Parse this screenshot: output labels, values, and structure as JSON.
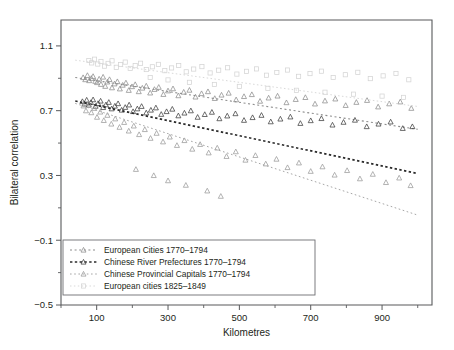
{
  "chart_data": {
    "type": "scatter",
    "title": "",
    "xlabel": "Kilometres",
    "ylabel": "Bilateral correlation",
    "xlim": [
      0,
      1040
    ],
    "ylim": [
      -0.5,
      1.26
    ],
    "grid": false,
    "legend_position": "bottom-left",
    "x_ticks_major": [
      100,
      300,
      500,
      700,
      900
    ],
    "x_ticks_minor": [
      0,
      200,
      400,
      600,
      800,
      1000
    ],
    "y_ticks_major": [
      1.1,
      0.7,
      0.3,
      -0.1,
      -0.5
    ],
    "y_ticks_minor": [
      0.9,
      0.5,
      0.1,
      -0.3
    ],
    "series": [
      {
        "name": "European Cities 1770–1794",
        "marker": "triangle",
        "color": "#8c8c8c",
        "line_color": "#8c8c8c",
        "line_dash": "2,2.6",
        "line_width": 1.1,
        "trend": {
          "x0": 40,
          "y0": 0.905,
          "x1": 1000,
          "y1": 0.585
        },
        "points": [
          [
            62,
            0.905
          ],
          [
            68,
            0.892
          ],
          [
            74,
            0.918
          ],
          [
            79,
            0.886
          ],
          [
            85,
            0.9
          ],
          [
            90,
            0.912
          ],
          [
            96,
            0.882
          ],
          [
            101,
            0.874
          ],
          [
            107,
            0.896
          ],
          [
            112,
            0.863
          ],
          [
            118,
            0.908
          ],
          [
            124,
            0.851
          ],
          [
            130,
            0.878
          ],
          [
            136,
            0.893
          ],
          [
            143,
            0.842
          ],
          [
            150,
            0.866
          ],
          [
            158,
            0.88
          ],
          [
            165,
            0.835
          ],
          [
            173,
            0.858
          ],
          [
            182,
            0.872
          ],
          [
            190,
            0.826
          ],
          [
            199,
            0.849
          ],
          [
            208,
            0.862
          ],
          [
            218,
            0.818
          ],
          [
            228,
            0.84
          ],
          [
            239,
            0.853
          ],
          [
            250,
            0.81
          ],
          [
            262,
            0.832
          ],
          [
            274,
            0.845
          ],
          [
            287,
            0.801
          ],
          [
            300,
            0.823
          ],
          [
            314,
            0.836
          ],
          [
            329,
            0.793
          ],
          [
            344,
            0.815
          ],
          [
            360,
            0.827
          ],
          [
            377,
            0.785
          ],
          [
            394,
            0.806
          ],
          [
            412,
            0.818
          ],
          [
            431,
            0.776
          ],
          [
            450,
            0.797
          ],
          [
            470,
            0.809
          ],
          [
            491,
            0.768
          ],
          [
            513,
            0.788
          ],
          [
            535,
            0.8
          ],
          [
            558,
            0.759
          ],
          [
            582,
            0.779
          ],
          [
            607,
            0.791
          ],
          [
            632,
            0.75
          ],
          [
            658,
            0.77
          ],
          [
            685,
            0.782
          ],
          [
            712,
            0.742
          ],
          [
            740,
            0.761
          ],
          [
            769,
            0.773
          ],
          [
            798,
            0.733
          ],
          [
            828,
            0.752
          ],
          [
            858,
            0.764
          ],
          [
            889,
            0.724
          ],
          [
            920,
            0.743
          ],
          [
            951,
            0.755
          ],
          [
            982,
            0.715
          ]
        ]
      },
      {
        "name": "Chinese River Prefectures 1770–1794",
        "marker": "triangle",
        "color": "#3c3c3c",
        "line_color": "#2b2b2b",
        "line_dash": "2.4,2.4",
        "line_width": 1.7,
        "trend": {
          "x0": 40,
          "y0": 0.76,
          "x1": 1000,
          "y1": 0.312
        },
        "points": [
          [
            60,
            0.757
          ],
          [
            66,
            0.742
          ],
          [
            72,
            0.766
          ],
          [
            78,
            0.735
          ],
          [
            84,
            0.751
          ],
          [
            90,
            0.768
          ],
          [
            97,
            0.728
          ],
          [
            104,
            0.745
          ],
          [
            111,
            0.76
          ],
          [
            118,
            0.72
          ],
          [
            126,
            0.737
          ],
          [
            134,
            0.752
          ],
          [
            142,
            0.712
          ],
          [
            151,
            0.729
          ],
          [
            160,
            0.744
          ],
          [
            170,
            0.704
          ],
          [
            180,
            0.721
          ],
          [
            191,
            0.736
          ],
          [
            202,
            0.695
          ],
          [
            214,
            0.712
          ],
          [
            226,
            0.727
          ],
          [
            239,
            0.687
          ],
          [
            252,
            0.704
          ],
          [
            266,
            0.718
          ],
          [
            281,
            0.678
          ],
          [
            296,
            0.695
          ],
          [
            312,
            0.71
          ],
          [
            329,
            0.669
          ],
          [
            346,
            0.686
          ],
          [
            364,
            0.7
          ],
          [
            383,
            0.66
          ],
          [
            403,
            0.677
          ],
          [
            423,
            0.691
          ],
          [
            444,
            0.651
          ],
          [
            466,
            0.668
          ],
          [
            489,
            0.682
          ],
          [
            513,
            0.641
          ],
          [
            537,
            0.658
          ],
          [
            562,
            0.672
          ],
          [
            588,
            0.632
          ],
          [
            615,
            0.649
          ],
          [
            643,
            0.662
          ],
          [
            671,
            0.622
          ],
          [
            700,
            0.639
          ],
          [
            730,
            0.652
          ],
          [
            761,
            0.612
          ],
          [
            792,
            0.629
          ],
          [
            824,
            0.642
          ],
          [
            857,
            0.602
          ],
          [
            890,
            0.618
          ],
          [
            924,
            0.631
          ],
          [
            958,
            0.591
          ],
          [
            985,
            0.602
          ]
        ]
      },
      {
        "name": "Chinese Provincial Capitals 1770–1794",
        "marker": "triangle",
        "color": "#9a9a9a",
        "line_color": "#a6a6a6",
        "line_dash": "1.6,2.6",
        "line_width": 1.0,
        "trend": {
          "x0": 40,
          "y0": 0.745,
          "x1": 1000,
          "y1": 0.055
        },
        "points": [
          [
            63,
            0.73
          ],
          [
            70,
            0.7
          ],
          [
            77,
            0.745
          ],
          [
            85,
            0.688
          ],
          [
            93,
            0.715
          ],
          [
            101,
            0.66
          ],
          [
            110,
            0.692
          ],
          [
            120,
            0.64
          ],
          [
            130,
            0.672
          ],
          [
            141,
            0.618
          ],
          [
            152,
            0.65
          ],
          [
            164,
            0.598
          ],
          [
            177,
            0.628
          ],
          [
            190,
            0.575
          ],
          [
            204,
            0.606
          ],
          [
            219,
            0.553
          ],
          [
            235,
            0.584
          ],
          [
            251,
            0.53
          ],
          [
            268,
            0.561
          ],
          [
            286,
            0.508
          ],
          [
            305,
            0.538
          ],
          [
            325,
            0.486
          ],
          [
            346,
            0.516
          ],
          [
            368,
            0.463
          ],
          [
            390,
            0.492
          ],
          [
            414,
            0.44
          ],
          [
            438,
            0.47
          ],
          [
            464,
            0.418
          ],
          [
            490,
            0.447
          ],
          [
            517,
            0.395
          ],
          [
            545,
            0.424
          ],
          [
            574,
            0.372
          ],
          [
            604,
            0.401
          ],
          [
            635,
            0.349
          ],
          [
            667,
            0.378
          ],
          [
            700,
            0.326
          ],
          [
            733,
            0.354
          ],
          [
            767,
            0.303
          ],
          [
            802,
            0.331
          ],
          [
            838,
            0.28
          ],
          [
            874,
            0.308
          ],
          [
            911,
            0.257
          ],
          [
            948,
            0.285
          ],
          [
            980,
            0.238
          ],
          [
            410,
            0.205
          ],
          [
            448,
            0.172
          ],
          [
            210,
            0.338
          ],
          [
            260,
            0.3
          ],
          [
            300,
            0.268
          ],
          [
            350,
            0.24
          ]
        ]
      },
      {
        "name": "European cities 1825–1849",
        "marker": "square",
        "color": "#d4d4d4",
        "line_color": "#d9d9d9",
        "line_dash": "1.5,2.4",
        "line_width": 1.0,
        "trend": {
          "x0": 40,
          "y0": 1.012,
          "x1": 1000,
          "y1": 0.726
        },
        "points": [
          [
            78,
            1.01
          ],
          [
            86,
            0.995
          ],
          [
            94,
            1.018
          ],
          [
            103,
            0.988
          ],
          [
            112,
            1.004
          ],
          [
            122,
            0.975
          ],
          [
            132,
            0.992
          ],
          [
            143,
            1.008
          ],
          [
            155,
            0.968
          ],
          [
            167,
            0.985
          ],
          [
            180,
            1.0
          ],
          [
            194,
            0.961
          ],
          [
            208,
            0.978
          ],
          [
            223,
            0.993
          ],
          [
            239,
            0.954
          ],
          [
            256,
            0.971
          ],
          [
            273,
            0.986
          ],
          [
            291,
            0.947
          ],
          [
            310,
            0.964
          ],
          [
            330,
            0.979
          ],
          [
            351,
            0.94
          ],
          [
            372,
            0.957
          ],
          [
            395,
            0.972
          ],
          [
            418,
            0.933
          ],
          [
            442,
            0.95
          ],
          [
            467,
            0.965
          ],
          [
            493,
            0.926
          ],
          [
            520,
            0.943
          ],
          [
            548,
            0.958
          ],
          [
            576,
            0.919
          ],
          [
            605,
            0.936
          ],
          [
            635,
            0.951
          ],
          [
            666,
            0.912
          ],
          [
            698,
            0.929
          ],
          [
            730,
            0.944
          ],
          [
            763,
            0.905
          ],
          [
            797,
            0.922
          ],
          [
            832,
            0.937
          ],
          [
            867,
            0.898
          ],
          [
            903,
            0.915
          ],
          [
            939,
            0.93
          ],
          [
            975,
            0.891
          ],
          [
            250,
            0.905
          ],
          [
            300,
            0.89
          ],
          [
            360,
            0.875
          ],
          [
            430,
            0.862
          ],
          [
            500,
            0.85
          ],
          [
            580,
            0.838
          ],
          [
            660,
            0.826
          ],
          [
            740,
            0.814
          ],
          [
            820,
            0.802
          ],
          [
            900,
            0.79
          ],
          [
            960,
            0.782
          ]
        ]
      }
    ]
  },
  "legend": {
    "items": [
      {
        "label": "European Cities 1770–1794"
      },
      {
        "label": "Chinese River Prefectures 1770–1794"
      },
      {
        "label": "Chinese Provincial Capitals 1770–1794"
      },
      {
        "label": "European cities 1825–1849"
      }
    ]
  },
  "axes": {
    "y_title": "Bilateral correlation",
    "x_title": "Kilometres",
    "y_labels": [
      "1.1",
      "0.7",
      "0.3",
      "−0.1",
      "−0.5"
    ],
    "x_labels": [
      "100",
      "300",
      "500",
      "700",
      "900"
    ]
  }
}
